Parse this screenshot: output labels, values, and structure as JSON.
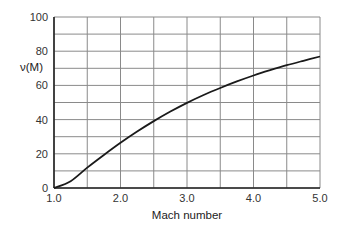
{
  "chart_data": {
    "type": "line",
    "title": "",
    "xlabel": "Mach number",
    "ylabel": "ν(M)",
    "xlim": [
      1.0,
      5.0
    ],
    "ylim": [
      0,
      100
    ],
    "x_ticks": [
      "1.0",
      "2.0",
      "3.0",
      "4.0",
      "5.0"
    ],
    "y_ticks": [
      "0",
      "20",
      "40",
      "60",
      "80",
      "100"
    ],
    "grid": true,
    "legend": null,
    "series": [
      {
        "name": "ν(M)",
        "x": [
          1.0,
          1.25,
          1.5,
          1.75,
          2.0,
          2.25,
          2.5,
          2.75,
          3.0,
          3.25,
          3.5,
          3.75,
          4.0,
          4.25,
          4.5,
          4.75,
          5.0
        ],
        "values": [
          0,
          4.0,
          11.9,
          19.3,
          26.4,
          33.0,
          39.1,
          44.7,
          49.8,
          54.4,
          58.5,
          62.3,
          65.8,
          68.9,
          71.8,
          74.4,
          76.9
        ]
      }
    ]
  }
}
